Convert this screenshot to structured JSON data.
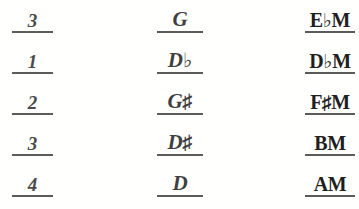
{
  "document": {
    "kind": "music-theory-answer-sheet",
    "ink_color": "#3a3a3a",
    "rule_color": "#5b5b5b",
    "background_color": "#ffffff",
    "columns": [
      {
        "name": "number-column",
        "label": "number"
      },
      {
        "name": "note-column",
        "label": "note"
      },
      {
        "name": "chord-column",
        "label": "chord"
      }
    ],
    "rows": [
      {
        "number": "3",
        "note_letter": "G",
        "note_accidental": "",
        "note_full": "G",
        "chord_letter": "E",
        "chord_accidental": "♭",
        "chord_quality": "M",
        "chord_full": "E♭M"
      },
      {
        "number": "1",
        "note_letter": "D",
        "note_accidental": "♭",
        "note_full": "D♭",
        "chord_letter": "D",
        "chord_accidental": "♭",
        "chord_quality": "M",
        "chord_full": "D♭M"
      },
      {
        "number": "2",
        "note_letter": "G",
        "note_accidental": "♯",
        "note_full": "G♯",
        "chord_letter": "F",
        "chord_accidental": "♯",
        "chord_quality": "M",
        "chord_full": "F♯M"
      },
      {
        "number": "3",
        "note_letter": "D",
        "note_accidental": "♯",
        "note_full": "D♯",
        "chord_letter": "B",
        "chord_accidental": "",
        "chord_quality": "M",
        "chord_full": "BM"
      },
      {
        "number": "4",
        "note_letter": "D",
        "note_accidental": "",
        "note_full": "D",
        "chord_letter": "A",
        "chord_accidental": "",
        "chord_quality": "M",
        "chord_full": "AM"
      }
    ]
  }
}
